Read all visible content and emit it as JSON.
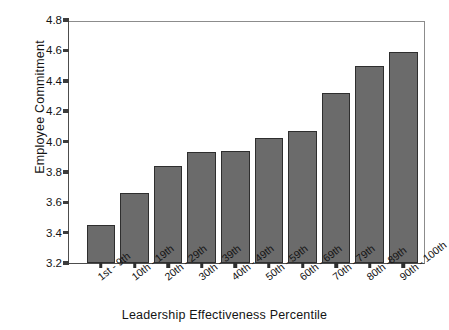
{
  "chart_data": {
    "type": "bar",
    "title": "",
    "xlabel": "Leadership Effectiveness Percentile",
    "ylabel": "Employee Commitment",
    "categories": [
      "1st - 9th",
      "10th - 19th",
      "20th - 29th",
      "30th - 39th",
      "40th - 49th",
      "50th - 59th",
      "60th - 69th",
      "70th - 79th",
      "80th -89th",
      "90th - 100th"
    ],
    "values": [
      3.45,
      3.66,
      3.84,
      3.93,
      3.94,
      4.02,
      4.07,
      4.32,
      4.5,
      4.59
    ],
    "ylim": [
      3.2,
      4.8
    ],
    "ytick_labels": [
      "3.2",
      "3.4",
      "3.6",
      "3.8",
      "4.0",
      "4.2",
      "4.4",
      "4.6",
      "4.8"
    ],
    "ytick_values": [
      3.2,
      3.4,
      3.6,
      3.8,
      4.0,
      4.2,
      4.4,
      4.6,
      4.8
    ],
    "ytick_step": 0.2,
    "grid": false,
    "legend": null,
    "bar_color": "#6b6b6b",
    "bar_edge_color": "#2e2e2e",
    "axis_color": "#3d3d3d",
    "background_color": "#ffffff"
  }
}
